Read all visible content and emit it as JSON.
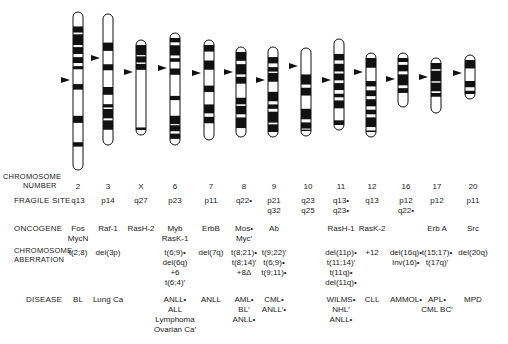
{
  "figure": {
    "row_labels": {
      "chromosome_number_1": "CHROMOSOME",
      "chromosome_number_2": "NUMBER",
      "fragile_site": "FRAGILE SITE",
      "oncogene": "ONCOGENE",
      "aberration_1": "CHROMOSOME",
      "aberration_2": "ABERRATION",
      "disease": "DISEASE"
    },
    "columns": [
      {
        "chromosome": "2",
        "x": 78,
        "fragile_site": [
          "q13"
        ],
        "oncogene": [
          "Fos",
          "MycN"
        ],
        "aberration": [
          "t(2;8)"
        ],
        "disease": [
          "BL"
        ]
      },
      {
        "chromosome": "3",
        "x": 108,
        "fragile_site": [
          "p14"
        ],
        "oncogene": [
          "Raf-1"
        ],
        "aberration": [
          "del(3p)"
        ],
        "disease": [
          "Lung Ca"
        ]
      },
      {
        "chromosome": "X",
        "x": 141,
        "fragile_site": [
          "q27"
        ],
        "oncogene": [
          "RasH-2"
        ],
        "aberration": [],
        "disease": []
      },
      {
        "chromosome": "6",
        "x": 175,
        "fragile_site": [
          "p23"
        ],
        "oncogene": [
          "Myb",
          "RasK-1"
        ],
        "aberration": [
          "t(6;9)•",
          "del(6q)",
          "+6",
          "t(6;4)′"
        ],
        "disease": [
          "ANLL•",
          "ALL",
          "Lymphoma",
          "Ovarian Ca′"
        ]
      },
      {
        "chromosome": "7",
        "x": 211,
        "fragile_site": [
          "p11"
        ],
        "oncogene": [
          "ErbB"
        ],
        "aberration": [
          "del(7q)"
        ],
        "disease": [
          "ANLL"
        ]
      },
      {
        "chromosome": "8",
        "x": 244,
        "fragile_site": [
          "q22•"
        ],
        "oncogene": [
          "Mos•",
          "Myc′"
        ],
        "aberration": [
          "t(8;21)•",
          "t(8;14)′",
          "+8Δ"
        ],
        "disease": [
          "AML•",
          "BL′",
          "ANLL•"
        ]
      },
      {
        "chromosome": "9",
        "x": 274,
        "fragile_site": [
          "p21",
          "q32"
        ],
        "oncogene": [
          "Ab"
        ],
        "aberration": [
          "t(9;22)′",
          "t(6;9)•",
          "t(9;11)•"
        ],
        "disease": [
          "CML•",
          "ANLL′•"
        ]
      },
      {
        "chromosome": "10",
        "x": 308,
        "fragile_site": [
          "q23",
          "q25"
        ],
        "oncogene": [],
        "aberration": [],
        "disease": []
      },
      {
        "chromosome": "11",
        "x": 341,
        "fragile_site": [
          "q13•",
          "q23•"
        ],
        "oncogene": [
          "RasH-1"
        ],
        "aberration": [
          "del(11p)•",
          "t(11;14)′",
          "t(11q)•",
          "del(11q)•"
        ],
        "disease": [
          "WILMS•",
          "NHL′",
          "ANLL•"
        ]
      },
      {
        "chromosome": "12",
        "x": 372,
        "fragile_site": [
          "q13"
        ],
        "oncogene": [
          "RasK-2"
        ],
        "aberration": [
          "+12"
        ],
        "disease": [
          "CLL"
        ]
      },
      {
        "chromosome": "16",
        "x": 406,
        "fragile_site": [
          "p12",
          "q22•"
        ],
        "oncogene": [],
        "aberration": [
          "del(16q)•",
          "inv(16)•"
        ],
        "disease": [
          "AMMOL•"
        ]
      },
      {
        "chromosome": "17",
        "x": 437,
        "fragile_site": [
          "p12"
        ],
        "oncogene": [
          "Erb A"
        ],
        "aberration": [
          "t(15;17)•",
          "t(17q)′"
        ],
        "disease": [
          "APL•",
          "CML BC′"
        ]
      },
      {
        "chromosome": "20",
        "x": 473,
        "fragile_site": [
          "p11"
        ],
        "oncogene": [
          "Src"
        ],
        "aberration": [
          "del(20q)"
        ],
        "disease": [
          "MPD"
        ]
      }
    ],
    "ideograms": [
      {
        "chromosome": "2",
        "cx": 78,
        "top": 12,
        "bottom": 170,
        "centromere": 80
      },
      {
        "chromosome": "3",
        "cx": 108,
        "top": 14,
        "bottom": 145,
        "centromere": 58
      },
      {
        "chromosome": "X",
        "cx": 141,
        "top": 40,
        "bottom": 135,
        "centromere": 72
      },
      {
        "chromosome": "6",
        "cx": 175,
        "top": 33,
        "bottom": 145,
        "centromere": 68
      },
      {
        "chromosome": "7",
        "cx": 209,
        "top": 40,
        "bottom": 140,
        "centromere": 73
      },
      {
        "chromosome": "8",
        "cx": 241,
        "top": 47,
        "bottom": 137,
        "centromere": 72
      },
      {
        "chromosome": "9",
        "cx": 273,
        "top": 47,
        "bottom": 137,
        "centromere": 80
      },
      {
        "chromosome": "10",
        "cx": 306,
        "top": 48,
        "bottom": 136,
        "centromere": 66
      },
      {
        "chromosome": "11",
        "cx": 339,
        "top": 39,
        "bottom": 130,
        "centromere": 80
      },
      {
        "chromosome": "12",
        "cx": 371,
        "top": 53,
        "bottom": 137,
        "centromere": 72
      },
      {
        "chromosome": "16",
        "cx": 403,
        "top": 53,
        "bottom": 107,
        "centromere": 79
      },
      {
        "chromosome": "17",
        "cx": 436,
        "top": 58,
        "bottom": 113,
        "centromere": 77
      },
      {
        "chromosome": "20",
        "cx": 470,
        "top": 55,
        "bottom": 99,
        "centromere": 73
      }
    ]
  }
}
